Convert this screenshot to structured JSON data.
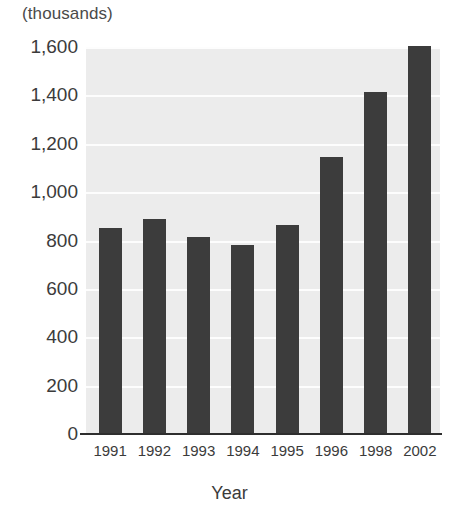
{
  "chart_data": {
    "type": "bar",
    "title": "",
    "subtitle": "",
    "unit_label": "(thousands)",
    "xlabel": "Year",
    "ylabel": "",
    "categories": [
      "1991",
      "1992",
      "1993",
      "1994",
      "1995",
      "1996",
      "1998",
      "2002"
    ],
    "values": [
      850,
      890,
      815,
      780,
      865,
      1145,
      1415,
      1605
    ],
    "series": [
      {
        "name": "",
        "values": [
          850,
          890,
          815,
          780,
          865,
          1145,
          1415,
          1605
        ]
      }
    ],
    "ylim": [
      0,
      1600
    ],
    "ytick_values": [
      0,
      200,
      400,
      600,
      800,
      1000,
      1200,
      1400,
      1600
    ],
    "ytick_labels": [
      "0",
      "200",
      "400",
      "600",
      "800",
      "1,000",
      "1,200",
      "1,400",
      "1,600"
    ],
    "grid": true,
    "grid_axis": "y",
    "legend": false,
    "legend_position": "none",
    "bar_color": "#3c3c3c",
    "plot_background": "#ececec",
    "gridline_color": "#fdfdfd",
    "axis_color": "#2e2e2e",
    "page_background": "#ffffff"
  }
}
